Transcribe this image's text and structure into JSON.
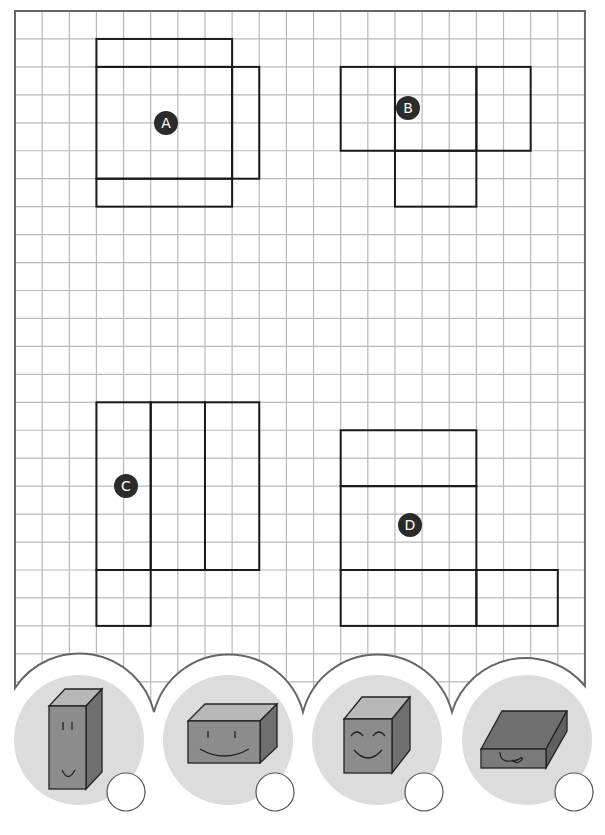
{
  "worksheet": {
    "grid": {
      "columns": 21,
      "rows": 24,
      "origin_x": 15,
      "origin_y": 11,
      "cell_w": 27.14,
      "cell_h": 27.95,
      "line_color": "#b8b8b8",
      "border_color": "#666666"
    },
    "nets": [
      {
        "label": "A",
        "badge": {
          "x": 166,
          "y": 123
        },
        "faces": [
          [
            3,
            1,
            8,
            2
          ],
          [
            3,
            2,
            8,
            6
          ],
          [
            8,
            2,
            9,
            6
          ],
          [
            3,
            6,
            8,
            7
          ]
        ]
      },
      {
        "label": "B",
        "badge": {
          "x": 408,
          "y": 108
        },
        "faces": [
          [
            12,
            2,
            14,
            5
          ],
          [
            14,
            2,
            17,
            5
          ],
          [
            17,
            2,
            19,
            5
          ],
          [
            14,
            5,
            17,
            7
          ]
        ]
      },
      {
        "label": "C",
        "badge": {
          "x": 126,
          "y": 486
        },
        "faces": [
          [
            3,
            14,
            5,
            20
          ],
          [
            5,
            14,
            7,
            20
          ],
          [
            7,
            14,
            9,
            20
          ],
          [
            3,
            20,
            5,
            22
          ]
        ]
      },
      {
        "label": "D",
        "badge": {
          "x": 410,
          "y": 525
        },
        "faces": [
          [
            12,
            15,
            17,
            17
          ],
          [
            12,
            17,
            17,
            20
          ],
          [
            12,
            20,
            17,
            22
          ],
          [
            17,
            20,
            20,
            22
          ]
        ]
      }
    ],
    "choices": [
      {
        "name": "tall-box",
        "shape": "tall rectangular prism",
        "face": "smile",
        "answer": ""
      },
      {
        "name": "wide-box",
        "shape": "wide rectangular prism",
        "face": "big smile",
        "answer": ""
      },
      {
        "name": "cube",
        "shape": "cube",
        "face": "happy closed eyes",
        "answer": ""
      },
      {
        "name": "flat-box",
        "shape": "flat rectangular prism",
        "face": "tongue out",
        "answer": ""
      }
    ],
    "colors": {
      "net_line": "#1a1a1a",
      "badge_bg": "#2b2b2b",
      "badge_text": "#ffffff",
      "bubble": "#dcdcdc",
      "box_front": "#8c8c8c",
      "box_top": "#b8b8b8",
      "box_side": "#6f6f6f"
    }
  }
}
